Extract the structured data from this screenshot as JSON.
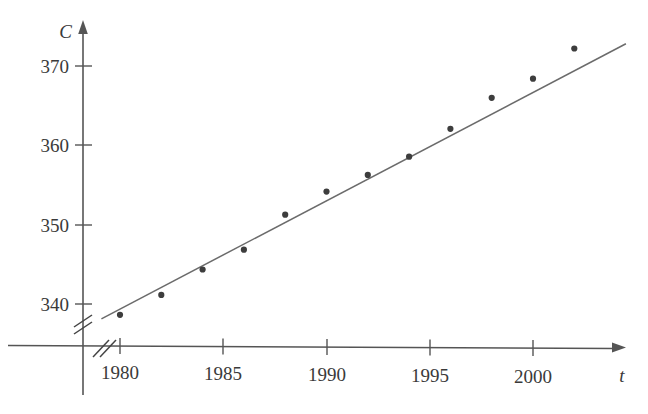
{
  "chart_data": {
    "type": "scatter",
    "title": "",
    "xlabel": "t",
    "ylabel": "C",
    "x": [
      1980,
      1982,
      1984,
      1986,
      1988,
      1990,
      1992,
      1994,
      1996,
      1998,
      2000,
      2002
    ],
    "values": [
      338.7,
      341.2,
      344.4,
      346.9,
      351.3,
      354.2,
      356.3,
      358.6,
      362.1,
      366.0,
      368.4,
      372.2
    ],
    "series": [
      {
        "name": "CO2 concentration",
        "values": [
          338.7,
          341.2,
          344.4,
          346.9,
          351.3,
          354.2,
          356.3,
          358.6,
          362.1,
          366.0,
          368.4,
          372.2
        ]
      },
      {
        "name": "regression line",
        "type": "line",
        "x": [
          1979.1,
          2004.5
        ],
        "values": [
          338.2,
          372.8
        ]
      }
    ],
    "xlim": [
      1978.3,
      2006.2
    ],
    "ylim": [
      335.2,
      374.5
    ],
    "xticks": [
      1980,
      1985,
      1990,
      1995,
      2000
    ],
    "xticklabels": [
      "1980",
      "1985",
      "1990",
      "1995",
      "2000"
    ],
    "yticks": [
      340,
      350,
      360,
      370
    ],
    "yticklabels": [
      "340",
      "350",
      "360",
      "370"
    ],
    "grid": false,
    "legend": "none",
    "axis_break_x": true,
    "axis_break_y": true,
    "marker": "filled-circle",
    "marker_color": "#3d3d3d",
    "line_color": "#6b6b6b",
    "axis_color": "#555555",
    "background": "#ffffff"
  }
}
